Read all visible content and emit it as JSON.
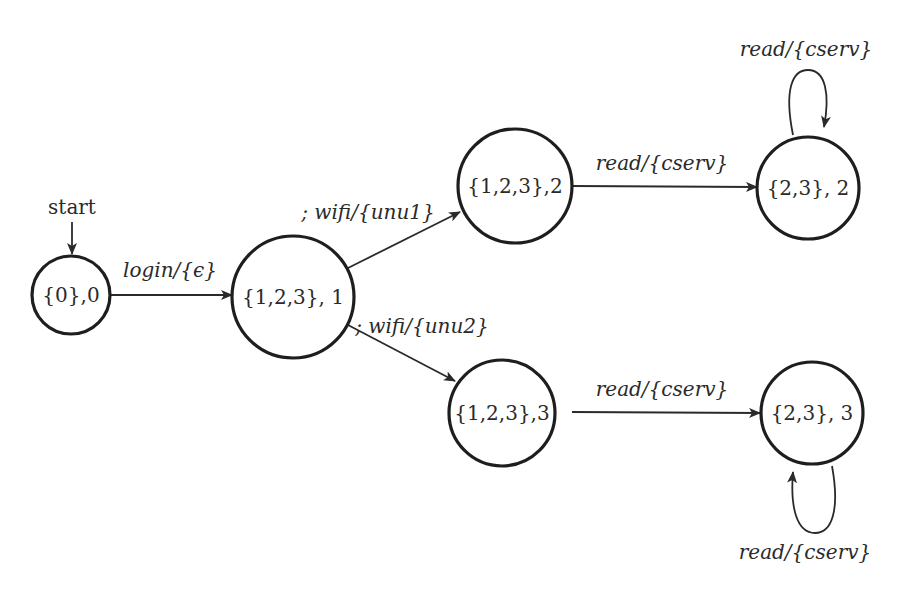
{
  "diagram": {
    "type": "state-machine",
    "start_label": "start",
    "nodes": [
      {
        "id": "s0",
        "label": "{0},0"
      },
      {
        "id": "s1",
        "label": "{1,2,3}, 1"
      },
      {
        "id": "s2",
        "label": "{1,2,3},2"
      },
      {
        "id": "s3",
        "label": "{1,2,3},3"
      },
      {
        "id": "s4",
        "label": "{2,3}, 2"
      },
      {
        "id": "s5",
        "label": "{2,3}, 3"
      }
    ],
    "edges": [
      {
        "from": "s0",
        "to": "s1",
        "label": "login/{ϵ}"
      },
      {
        "from": "s1",
        "to": "s2",
        "label": "; wifi/{unu1}"
      },
      {
        "from": "s1",
        "to": "s3",
        "label": "; wifi/{unu2}"
      },
      {
        "from": "s2",
        "to": "s4",
        "label": "read/{cserv}"
      },
      {
        "from": "s3",
        "to": "s5",
        "label": "read/{cserv}"
      },
      {
        "from": "s4",
        "to": "s4",
        "label": "read/{cserv}"
      },
      {
        "from": "s5",
        "to": "s5",
        "label": "read/{cserv}"
      }
    ]
  }
}
